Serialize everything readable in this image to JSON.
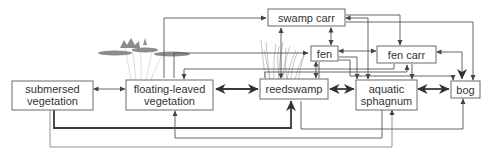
{
  "diagram": {
    "type": "succession-flow-diagram",
    "nodes": [
      {
        "id": "submersed",
        "label_lines": [
          "submersed",
          "vegetation"
        ]
      },
      {
        "id": "floating",
        "label_lines": [
          "floating-leaved",
          "vegetation"
        ]
      },
      {
        "id": "reedswamp",
        "label_lines": [
          "reedswamp"
        ]
      },
      {
        "id": "swamp_carr",
        "label_lines": [
          "swamp carr"
        ]
      },
      {
        "id": "fen",
        "label_lines": [
          "fen"
        ]
      },
      {
        "id": "fen_carr",
        "label_lines": [
          "fen carr"
        ]
      },
      {
        "id": "aquatic_sphagnum",
        "label_lines": [
          "aquatic",
          "sphagnum"
        ]
      },
      {
        "id": "bog",
        "label_lines": [
          "bog"
        ]
      }
    ],
    "edges": [
      {
        "from": "submersed",
        "to": "floating",
        "bidirectional": true,
        "weight": "normal"
      },
      {
        "from": "floating",
        "to": "reedswamp",
        "bidirectional": true,
        "weight": "thick"
      },
      {
        "from": "reedswamp",
        "to": "aquatic_sphagnum",
        "bidirectional": true,
        "weight": "thick"
      },
      {
        "from": "aquatic_sphagnum",
        "to": "bog",
        "bidirectional": true,
        "weight": "thick"
      },
      {
        "from": "submersed",
        "to": "reedswamp",
        "bidirectional": false,
        "weight": "thick"
      },
      {
        "from": "submersed",
        "to": "aquatic_sphagnum",
        "bidirectional": false,
        "weight": "normal"
      },
      {
        "from": "aquatic_sphagnum",
        "to": "floating",
        "bidirectional": false,
        "weight": "normal"
      },
      {
        "from": "reedswamp",
        "to": "bog",
        "bidirectional": false,
        "weight": "normal"
      },
      {
        "from": "floating",
        "to": "swamp_carr",
        "bidirectional": false,
        "weight": "normal"
      },
      {
        "from": "floating",
        "to": "fen",
        "bidirectional": false,
        "weight": "normal"
      },
      {
        "from": "fen_carr",
        "to": "floating",
        "bidirectional": false,
        "weight": "normal"
      },
      {
        "from": "swamp_carr",
        "to": "fen",
        "bidirectional": true,
        "weight": "normal"
      },
      {
        "from": "reedswamp",
        "to": "swamp_carr",
        "bidirectional": true,
        "weight": "normal"
      },
      {
        "from": "reedswamp",
        "to": "fen",
        "bidirectional": true,
        "weight": "normal"
      },
      {
        "from": "fen",
        "to": "fen_carr",
        "bidirectional": true,
        "weight": "normal"
      },
      {
        "from": "fen",
        "to": "aquatic_sphagnum",
        "bidirectional": false,
        "weight": "normal"
      },
      {
        "from": "fen",
        "to": "bog",
        "bidirectional": false,
        "weight": "normal"
      },
      {
        "from": "swamp_carr",
        "to": "fen_carr",
        "bidirectional": false,
        "weight": "normal"
      },
      {
        "from": "swamp_carr",
        "to": "aquatic_sphagnum",
        "bidirectional": true,
        "weight": "normal"
      },
      {
        "from": "swamp_carr",
        "to": "bog",
        "bidirectional": false,
        "weight": "normal"
      },
      {
        "from": "fen_carr",
        "to": "aquatic_sphagnum",
        "bidirectional": false,
        "weight": "normal"
      },
      {
        "from": "fen_carr",
        "to": "bog",
        "bidirectional": true,
        "weight": "thick"
      },
      {
        "from": "reedswamp",
        "to": "fen_carr",
        "bidirectional": false,
        "weight": "normal"
      }
    ],
    "illustrations": [
      "water-lily-icon",
      "reed-grass-icon"
    ]
  }
}
